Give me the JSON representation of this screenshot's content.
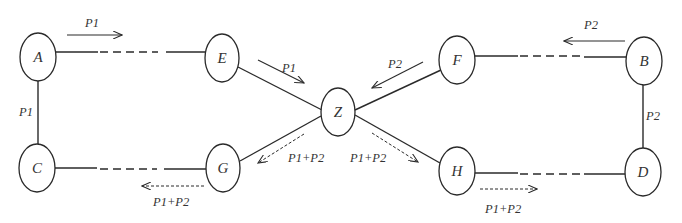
{
  "diagram": {
    "title": "",
    "nodes": [
      {
        "id": "A",
        "label": "A",
        "cx": 38,
        "cy": 57,
        "rx": 18,
        "ry": 24
      },
      {
        "id": "C",
        "label": "C",
        "cx": 37,
        "cy": 168,
        "rx": 18,
        "ry": 24
      },
      {
        "id": "E",
        "label": "E",
        "cx": 222,
        "cy": 58,
        "rx": 17,
        "ry": 24
      },
      {
        "id": "G",
        "label": "G",
        "cx": 223,
        "cy": 168,
        "rx": 17,
        "ry": 24
      },
      {
        "id": "Z",
        "label": "Z",
        "cx": 338,
        "cy": 112,
        "rx": 17,
        "ry": 24
      },
      {
        "id": "F",
        "label": "F",
        "cx": 457,
        "cy": 60,
        "rx": 18,
        "ry": 24
      },
      {
        "id": "H",
        "label": "H",
        "cx": 457,
        "cy": 171,
        "rx": 18,
        "ry": 24
      },
      {
        "id": "B",
        "label": "B",
        "cx": 644,
        "cy": 61,
        "rx": 18,
        "ry": 24
      },
      {
        "id": "D",
        "label": "D",
        "cx": 643,
        "cy": 172,
        "rx": 18,
        "ry": 24
      }
    ],
    "edges": [
      {
        "from": "A",
        "to": "E",
        "style": "solid-dashed-solid"
      },
      {
        "from": "C",
        "to": "G",
        "style": "solid-dashed-solid"
      },
      {
        "from": "F",
        "to": "B",
        "style": "solid-dashed-solid"
      },
      {
        "from": "H",
        "to": "D",
        "style": "solid-dashed-solid"
      },
      {
        "from": "A",
        "to": "C",
        "style": "solid"
      },
      {
        "from": "B",
        "to": "D",
        "style": "solid"
      },
      {
        "from": "E",
        "to": "Z",
        "style": "solid"
      },
      {
        "from": "F",
        "to": "Z",
        "style": "solid"
      },
      {
        "from": "Z",
        "to": "G",
        "style": "solid"
      },
      {
        "from": "Z",
        "to": "H",
        "style": "solid"
      }
    ],
    "flows": [
      {
        "id": "flow-a-e",
        "label": "P1",
        "style": "solid",
        "direction": "A→E"
      },
      {
        "id": "flow-a-c",
        "label": "P1",
        "style": "none",
        "direction": "A–C"
      },
      {
        "id": "flow-e-z",
        "label": "P1",
        "style": "solid",
        "direction": "E→Z"
      },
      {
        "id": "flow-b-f",
        "label": "P2",
        "style": "solid",
        "direction": "B→F"
      },
      {
        "id": "flow-b-d",
        "label": "P2",
        "style": "none",
        "direction": "B–D"
      },
      {
        "id": "flow-f-z",
        "label": "P2",
        "style": "solid",
        "direction": "F→Z"
      },
      {
        "id": "flow-z-g",
        "label": "P1+P2",
        "style": "dotted",
        "direction": "Z→G"
      },
      {
        "id": "flow-g-c",
        "label": "P1+P2",
        "style": "dotted",
        "direction": "G→C"
      },
      {
        "id": "flow-z-h",
        "label": "P1+P2",
        "style": "dotted",
        "direction": "Z→H"
      },
      {
        "id": "flow-h-d",
        "label": "P1+P2",
        "style": "dotted",
        "direction": "H→D"
      }
    ]
  }
}
